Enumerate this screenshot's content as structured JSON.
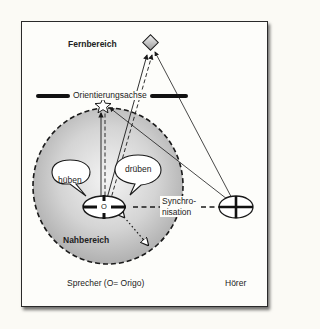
{
  "diagram": {
    "labels": {
      "far_zone": "Fernbereich",
      "orientation_axis": "Orientierungsachse",
      "near_zone": "Nahbereich",
      "bubble_left": "hüben",
      "bubble_right": "drüben",
      "origo_mark": "O",
      "synchronisation_line1": "Synchro-",
      "synchronisation_line2": "nisation",
      "speaker": "Sprecher (O= Origo)",
      "listener": "Hörer"
    },
    "colors": {
      "stroke": "#1a1a1a",
      "zone_fill_center": "#f2f2f2",
      "zone_fill_edge": "#a9a9a9",
      "background": "#fdfdfa"
    }
  }
}
